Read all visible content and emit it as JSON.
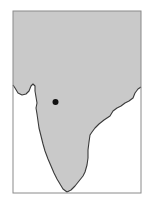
{
  "map": {
    "region": "Indian subcontinent",
    "colors": {
      "land": "#c9c9c9",
      "water": "#ffffff",
      "coastline": "#3a3a3a",
      "frame": "#8a8a8a",
      "marker": "#111111"
    },
    "marker": {
      "type": "dot",
      "x": 55.5,
      "y": 102,
      "r": 3
    }
  }
}
